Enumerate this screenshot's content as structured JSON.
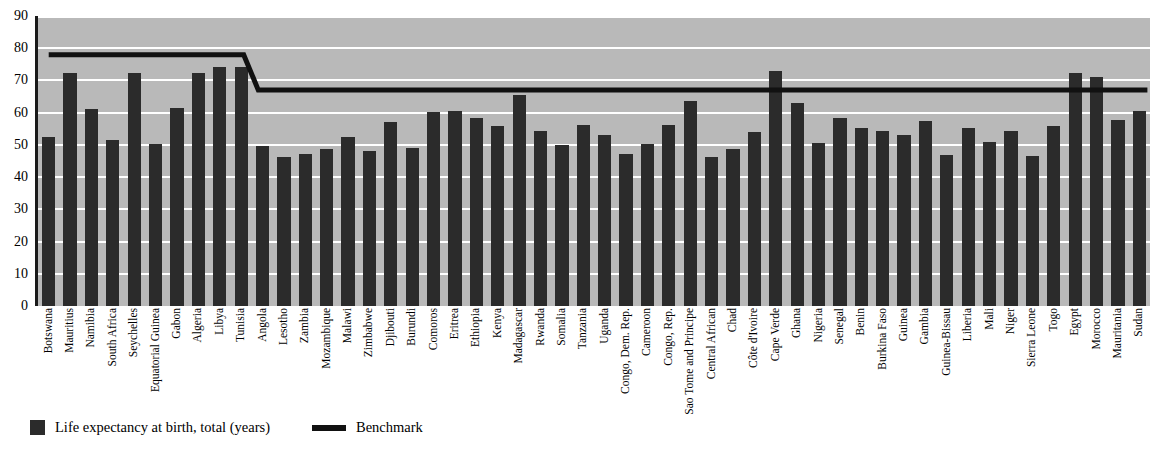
{
  "chart_data": {
    "type": "bar",
    "title": "",
    "xlabel": "",
    "ylabel": "",
    "ylim": [
      0,
      90
    ],
    "yticks": [
      0,
      10,
      20,
      30,
      40,
      50,
      60,
      70,
      80,
      90
    ],
    "grid": true,
    "legend_position": "bottom-left",
    "categories": [
      "Botswana",
      "Mauritius",
      "Namibia",
      "South Africa",
      "Seychelles",
      "Equatorial Guinea",
      "Gabon",
      "Algeria",
      "Libya",
      "Tunisia",
      "Angola",
      "Lesotho",
      "Zambia",
      "Mozambique",
      "Malawi",
      "Zimbabwe",
      "Djibouti",
      "Burundi",
      "Comoros",
      "Eritrea",
      "Ethiopia",
      "Kenya",
      "Madagascar",
      "Rwanda",
      "Somalia",
      "Tanzania",
      "Uganda",
      "Congo, Dem. Rep.",
      "Cameroon",
      "Congo, Rep.",
      "Sao Tome and Principe",
      "Central African",
      "Chad",
      "Côte d'Ivoire",
      "Cape Verde",
      "Ghana",
      "Nigeria",
      "Senegal",
      "Benin",
      "Burkina Faso",
      "Guinea",
      "Gambia",
      "Guinea-Bissau",
      "Liberia",
      "Mali",
      "Niger",
      "Sierra Leone",
      "Togo",
      "Egypt",
      "Morocco",
      "Mauritania",
      "Sudan"
    ],
    "series": [
      {
        "name": "Life expectancy at birth, total (years)",
        "color": "#2b2b2b",
        "values": [
          52.5,
          72.3,
          61.2,
          51.4,
          72.4,
          50.2,
          61.4,
          72.2,
          74.1,
          74.2,
          49.6,
          46.3,
          47.2,
          48.8,
          52.4,
          48.1,
          57.0,
          49.1,
          60.1,
          60.5,
          58.3,
          55.8,
          65.6,
          54.4,
          50.1,
          56.2,
          53.0,
          47.3,
          50.3,
          56.3,
          63.7,
          46.4,
          48.6,
          53.9,
          73.0,
          62.9,
          50.6,
          58.2,
          55.1,
          54.3,
          53.2,
          57.5,
          47.0,
          55.2,
          50.8,
          54.2,
          46.6,
          55.9,
          72.2,
          71.2,
          57.8,
          60.4
        ]
      }
    ],
    "benchmark": {
      "name": "Benchmark",
      "color": "#111111",
      "high_value": 78,
      "low_value": 67,
      "step_after_category": "Tunisia",
      "description": "Constant at 78 years for Botswana through Tunisia, then steps down to 67 years for Angola through Sudan"
    }
  },
  "legend": {
    "bar_label": "Life expectancy at birth, total (years)",
    "line_label": "Benchmark"
  }
}
